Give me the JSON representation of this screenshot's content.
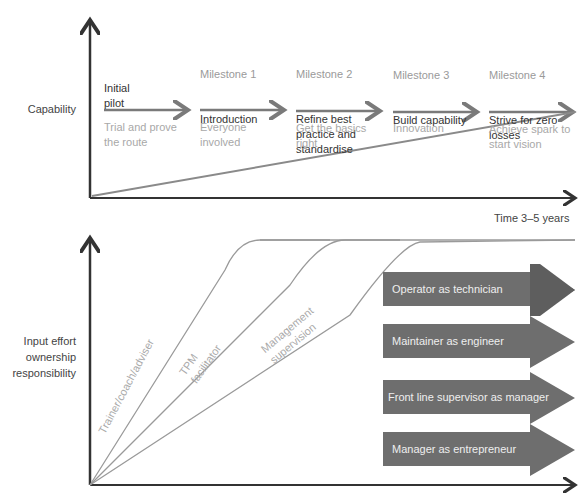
{
  "top_chart": {
    "y_label": "Capability",
    "x_label": "Time 3–5 years",
    "stages": [
      {
        "milestone": "",
        "title": "Initial\npilot",
        "description": "Trial and prove\nthe route"
      },
      {
        "milestone": "Milestone 1",
        "title": "Introduction",
        "description": "Everyone\ninvolved"
      },
      {
        "milestone": "Milestone 2",
        "title": "Refine best\npractice and\nstandardise",
        "description": "Get the basics\nright"
      },
      {
        "milestone": "Milestone 3",
        "title": "Build capability",
        "description": "Innovation"
      },
      {
        "milestone": "Milestone 4",
        "title": "Strive for zero\nlosses",
        "description": "Achieve spark to\nstart vision"
      }
    ]
  },
  "bottom_chart": {
    "y_label": "Input effort\nownership\nresponsibility",
    "curves": [
      "Trainer/coach/adviser",
      "TPM\nfacilitator",
      "Management\nsupervision"
    ],
    "roles": [
      "Operator as technician",
      "Maintainer as engineer",
      "Front line supervisor as manager",
      "Manager as entrepreneur"
    ]
  },
  "colors": {
    "axis": "#333333",
    "arrow": "#7a7a7a",
    "band": "#6e6e6e",
    "curve": "#9a9a9a"
  }
}
